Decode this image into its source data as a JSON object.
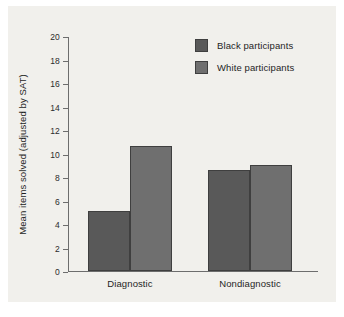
{
  "chart_data": {
    "type": "bar",
    "title": "",
    "xlabel": "",
    "ylabel": "Mean items solved (adjusted by SAT)",
    "categories": [
      "Diagnostic",
      "Nondiagnostic"
    ],
    "ylim": [
      0,
      20
    ],
    "ytick_step": 2,
    "yticks": [
      "20",
      "18",
      "16",
      "14",
      "12",
      "10",
      "8",
      "6",
      "4",
      "2",
      "0"
    ],
    "grid": false,
    "legend_position": "top-right",
    "series": [
      {
        "name": "Black participants",
        "color": "#595959",
        "values": [
          5.1,
          8.6
        ]
      },
      {
        "name": "White participants",
        "color": "#6f6f6f",
        "values": [
          10.6,
          9.0
        ]
      }
    ]
  },
  "figure": {
    "background": "#f1f0ec",
    "axis_color": "#6d6d6d",
    "bar_edge_color": "#3f3f3f"
  }
}
